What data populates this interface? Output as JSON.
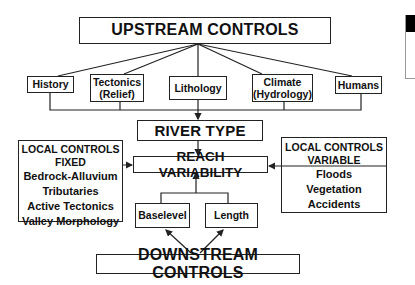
{
  "diagram": {
    "upstream": {
      "title": "UPSTREAM CONTROLS"
    },
    "upstream_factors": [
      {
        "line1": "History",
        "line2": ""
      },
      {
        "line1": "Tectonics",
        "line2": "(Relief)"
      },
      {
        "line1": "Lithology",
        "line2": ""
      },
      {
        "line1": "Climate",
        "line2": "(Hydrology)"
      },
      {
        "line1": "Humans",
        "line2": ""
      }
    ],
    "river_type": "RIVER TYPE",
    "reach_variability": "REACH VARIABILITY",
    "local_fixed": {
      "title1": "LOCAL CONTROLS",
      "title2": "FIXED",
      "items": [
        "Bedrock-Alluvium",
        "Tributaries",
        "Active Tectonics",
        "Valley Morphology"
      ]
    },
    "local_variable": {
      "title1": "LOCAL CONTROLS",
      "title2": "VARIABLE",
      "items": [
        "Floods",
        "Vegetation",
        "Accidents"
      ]
    },
    "downstream_factors": [
      "Baselevel",
      "Length"
    ],
    "downstream": {
      "title": "DOWNSTREAM CONTROLS"
    },
    "colors": {
      "line": "#222222",
      "background": "#ffffff"
    }
  }
}
